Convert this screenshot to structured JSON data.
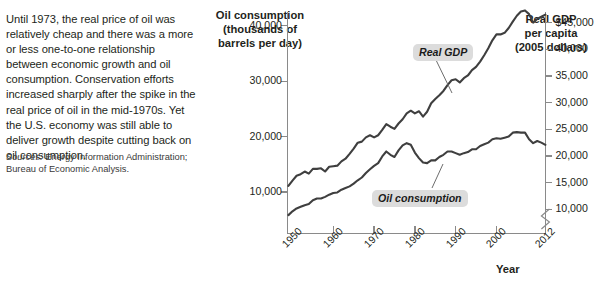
{
  "blurb": "Until 1973, the real price of oil was relatively cheap and there was a more or less one-to-one relationship between economic growth and oil consumption. Conservation efforts increased sharply after the spike in the real price of oil in the mid-1970s. Yet the U.S. economy was still able to deliver growth despite cutting back on oil consumption.",
  "sources": {
    "prefix": "Sources:",
    "text": " Energy Information Administration; Bureau of Economic Analysis."
  },
  "chart_data": {
    "type": "line",
    "title": "",
    "xlabel": "Year",
    "left_axis": {
      "label": "Oil consumption\n(thousands of\nbarrels per day)",
      "label_lines": [
        "Oil consumption",
        "(thousands of",
        "barrels per day)"
      ],
      "ticks": [
        "10,000",
        "20,000",
        "30,000",
        "40,000"
      ],
      "tick_values": [
        10000,
        20000,
        30000,
        40000
      ],
      "ylim": [
        2500,
        42500
      ]
    },
    "right_axis": {
      "label": "Real GDP\nper capita\n(2005 dollars)",
      "label_lines": [
        "Real GDP",
        "per capita",
        "(2005 dollars)"
      ],
      "ticks": [
        "10,000",
        "15,000",
        "20,000",
        "25,000",
        "30,000",
        "35,000",
        "40,000",
        "$45,000"
      ],
      "tick_values": [
        10000,
        15000,
        20000,
        25000,
        30000,
        35000,
        40000,
        45000
      ],
      "ylim": [
        5500,
        47000
      ],
      "axis_break": true
    },
    "x_ticks": [
      "1950",
      "1960",
      "1970",
      "1980",
      "1990",
      "2000",
      "2012"
    ],
    "x_tick_values": [
      1950,
      1960,
      1970,
      1980,
      1990,
      2000,
      2012
    ],
    "xlim": [
      1949,
      2012
    ],
    "grid": false,
    "legend_position": "inline-callouts",
    "series": [
      {
        "name": "Real GDP",
        "axis": "right",
        "unit": "2005 dollars per capita",
        "color": "#3f3f3f",
        "x": [
          1949,
          1950,
          1951,
          1952,
          1953,
          1954,
          1955,
          1956,
          1957,
          1958,
          1959,
          1960,
          1961,
          1962,
          1963,
          1964,
          1965,
          1966,
          1967,
          1968,
          1969,
          1970,
          1971,
          1972,
          1973,
          1974,
          1975,
          1976,
          1977,
          1978,
          1979,
          1980,
          1981,
          1982,
          1983,
          1984,
          1985,
          1986,
          1987,
          1988,
          1989,
          1990,
          1991,
          1992,
          1993,
          1994,
          1995,
          1996,
          1997,
          1998,
          1999,
          2000,
          2001,
          2002,
          2003,
          2004,
          2005,
          2006,
          2007,
          2008,
          2009,
          2010,
          2011,
          2012
        ],
        "values": [
          14400,
          15400,
          16300,
          16600,
          17100,
          16700,
          17600,
          17600,
          17700,
          17100,
          18000,
          18100,
          18200,
          19000,
          19500,
          20400,
          21400,
          22500,
          22700,
          23500,
          23900,
          23500,
          23900,
          24900,
          26000,
          25500,
          25100,
          26100,
          26900,
          28000,
          28500,
          28000,
          28400,
          27400,
          28300,
          29900,
          30700,
          31400,
          32200,
          33300,
          34200,
          34400,
          33800,
          34600,
          35100,
          36100,
          36700,
          37700,
          38900,
          40200,
          41700,
          42800,
          42800,
          43100,
          44000,
          45200,
          46300,
          47100,
          47300,
          46600,
          45000,
          45700,
          46100,
          46500
        ]
      },
      {
        "name": "Oil consumption",
        "axis": "left",
        "unit": "thousands of barrels per day",
        "color": "#3f3f3f",
        "x": [
          1949,
          1950,
          1951,
          1952,
          1953,
          1954,
          1955,
          1956,
          1957,
          1958,
          1959,
          1960,
          1961,
          1962,
          1963,
          1964,
          1965,
          1966,
          1967,
          1968,
          1969,
          1970,
          1971,
          1972,
          1973,
          1974,
          1975,
          1976,
          1977,
          1978,
          1979,
          1980,
          1981,
          1982,
          1983,
          1984,
          1985,
          1986,
          1987,
          1988,
          1989,
          1990,
          1991,
          1992,
          1993,
          1994,
          1995,
          1996,
          1997,
          1998,
          1999,
          2000,
          2001,
          2002,
          2003,
          2004,
          2005,
          2006,
          2007,
          2008,
          2009,
          2010,
          2011,
          2012
        ],
        "values": [
          5800,
          6500,
          7000,
          7300,
          7600,
          7800,
          8500,
          8800,
          8800,
          9100,
          9500,
          9800,
          9900,
          10400,
          10700,
          11000,
          11500,
          12100,
          12600,
          13400,
          14100,
          14700,
          15200,
          16400,
          17300,
          16700,
          16300,
          17500,
          18400,
          18800,
          18500,
          17100,
          16100,
          15300,
          15200,
          15700,
          15700,
          16300,
          16700,
          17300,
          17300,
          17000,
          16700,
          17000,
          17200,
          17700,
          17700,
          18300,
          18600,
          18900,
          19500,
          19700,
          19600,
          19800,
          20000,
          20700,
          20800,
          20700,
          20700,
          19500,
          18800,
          19200,
          18900,
          18500
        ]
      }
    ],
    "annotations": [
      {
        "text": "Real GDP",
        "series": "Real GDP"
      },
      {
        "text": "Oil consumption",
        "series": "Oil consumption"
      }
    ]
  }
}
